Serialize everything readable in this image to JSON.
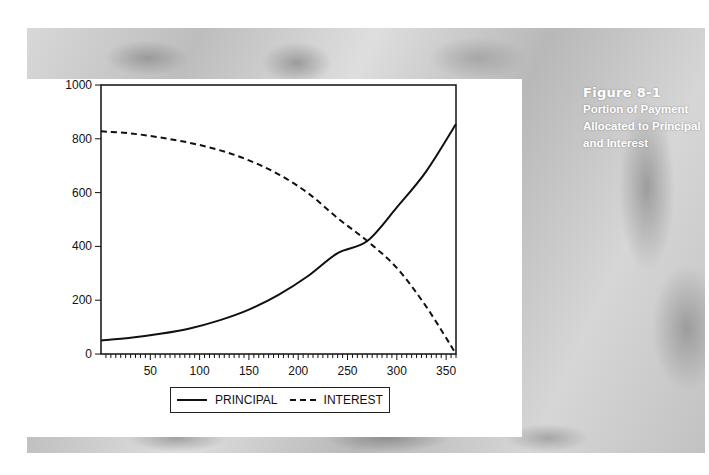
{
  "caption": {
    "figure_label": "Figure 8-1",
    "description": "Portion of Payment Allocated to Principal and Interest"
  },
  "chart_data": {
    "type": "line",
    "xlabel": "",
    "ylabel": "",
    "xlim": [
      0,
      360
    ],
    "ylim": [
      0,
      1000
    ],
    "x_ticks": [
      50,
      100,
      150,
      200,
      250,
      300,
      350
    ],
    "y_ticks": [
      0,
      200,
      400,
      600,
      800,
      1000
    ],
    "grid": false,
    "legend_position": "bottom",
    "x": [
      0,
      30,
      60,
      90,
      120,
      150,
      180,
      210,
      240,
      270,
      300,
      330,
      360
    ],
    "series": [
      {
        "name": "PRINCIPAL",
        "style": "solid",
        "values": [
          50,
          60,
          75,
          95,
          125,
          165,
          220,
          290,
          375,
          420,
          545,
          680,
          855
        ]
      },
      {
        "name": "INTEREST",
        "style": "dashed",
        "values": [
          828,
          820,
          805,
          785,
          758,
          720,
          668,
          598,
          505,
          420,
          320,
          175,
          0
        ]
      }
    ]
  },
  "legend": {
    "items": [
      {
        "label": "PRINCIPAL",
        "style": "solid"
      },
      {
        "label": "INTEREST",
        "style": "dashed"
      }
    ]
  }
}
